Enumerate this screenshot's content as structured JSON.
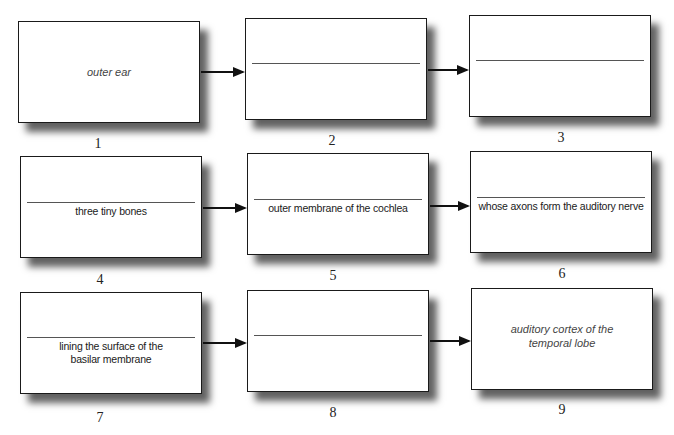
{
  "diagram": {
    "type": "flowchart",
    "layout": "3x3 grid, left-to-right arrows within each row",
    "boxes": [
      {
        "number": "1",
        "label": "outer ear",
        "label_style": "italic",
        "has_blank_line": false,
        "answer_text": ""
      },
      {
        "number": "2",
        "label": "",
        "has_blank_line": true,
        "answer_text": ""
      },
      {
        "number": "3",
        "label": "",
        "has_blank_line": true,
        "answer_text": ""
      },
      {
        "number": "4",
        "label": "",
        "has_blank_line": true,
        "answer_text": "three tiny bones"
      },
      {
        "number": "5",
        "label": "",
        "has_blank_line": true,
        "answer_text": "outer membrane of the cochlea"
      },
      {
        "number": "6",
        "label": "",
        "has_blank_line": true,
        "answer_text": "whose axons form the auditory nerve"
      },
      {
        "number": "7",
        "label": "",
        "has_blank_line": true,
        "answer_text_line1": "lining the surface of the",
        "answer_text_line2": "basilar membrane"
      },
      {
        "number": "8",
        "label": "",
        "has_blank_line": true,
        "answer_text": ""
      },
      {
        "number": "9",
        "label_line1": "auditory cortex of the",
        "label_line2": "temporal lobe",
        "label_style": "italic",
        "has_blank_line": false
      }
    ],
    "connections": [
      {
        "from": "1",
        "to": "2"
      },
      {
        "from": "2",
        "to": "3"
      },
      {
        "from": "4",
        "to": "5"
      },
      {
        "from": "5",
        "to": "6"
      },
      {
        "from": "7",
        "to": "8"
      },
      {
        "from": "8",
        "to": "9"
      }
    ],
    "colors": {
      "border": "#1a1a1a",
      "shadow": "#5a5a5a",
      "italic_text": "#444444",
      "answer_text": "#1a1a1a",
      "arrow": "#111111"
    }
  }
}
